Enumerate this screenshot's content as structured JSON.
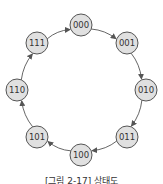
{
  "diagram": {
    "type": "state-diagram",
    "caption": "[그림 2-17] 상태도",
    "node_fill": "#e0e0e0",
    "node_stroke": "#555555",
    "edge_color": "#555555",
    "nodes": [
      {
        "id": "000",
        "label": "000",
        "x": 81,
        "y": 25
      },
      {
        "id": "001",
        "label": "001",
        "x": 127,
        "y": 43
      },
      {
        "id": "010",
        "label": "010",
        "x": 146,
        "y": 90
      },
      {
        "id": "011",
        "label": "011",
        "x": 127,
        "y": 137
      },
      {
        "id": "100",
        "label": "100",
        "x": 81,
        "y": 155
      },
      {
        "id": "101",
        "label": "101",
        "x": 37,
        "y": 137
      },
      {
        "id": "110",
        "label": "110",
        "x": 17,
        "y": 90
      },
      {
        "id": "111",
        "label": "111",
        "x": 37,
        "y": 43
      }
    ],
    "edges": [
      {
        "from": "000",
        "to": "001"
      },
      {
        "from": "001",
        "to": "010"
      },
      {
        "from": "010",
        "to": "011"
      },
      {
        "from": "011",
        "to": "100"
      },
      {
        "from": "100",
        "to": "101"
      },
      {
        "from": "101",
        "to": "110"
      },
      {
        "from": "110",
        "to": "111"
      },
      {
        "from": "111",
        "to": "000"
      }
    ]
  }
}
